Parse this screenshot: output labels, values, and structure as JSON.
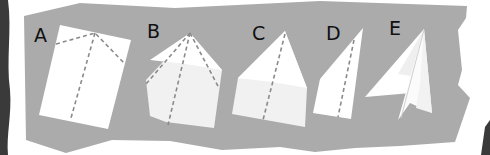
{
  "diagram": {
    "colors": {
      "background_panel": "#ababab",
      "paper_white": "#ffffff",
      "paper_shade": "#f0f0f0",
      "fold_line": "#8a8a8a",
      "label_text": "#111111",
      "edge_dark": "#3a3a3a"
    },
    "steps": [
      {
        "label": "A",
        "description": "Rectangular sheet with fold lines from top center"
      },
      {
        "label": "B",
        "description": "Top corners folded to the center line"
      },
      {
        "label": "C",
        "description": "Folded point with center crease"
      },
      {
        "label": "D",
        "description": "Folded in half along the center crease"
      },
      {
        "label": "E",
        "description": "Wings folded down — finished paper airplane"
      }
    ]
  }
}
